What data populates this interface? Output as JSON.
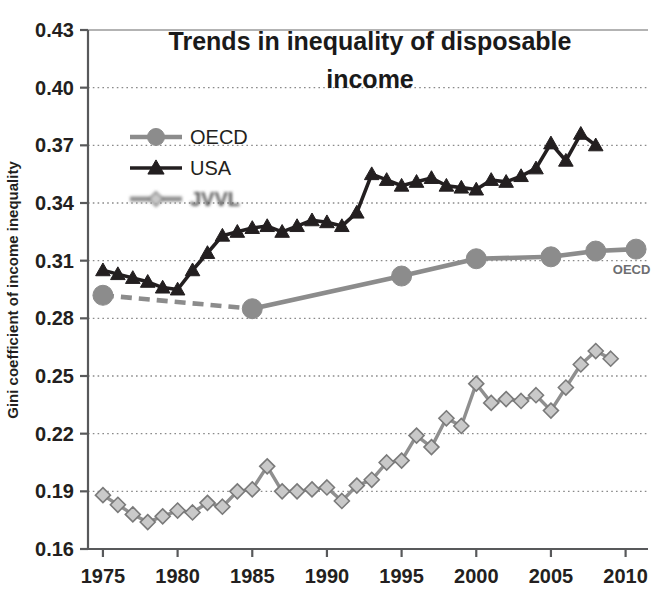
{
  "chart_data": {
    "type": "line",
    "title": "Trends in inequality of disposable income",
    "xlabel": "",
    "ylabel": "Gini coefficient of income inequality",
    "xlim": [
      1974,
      2011.5
    ],
    "ylim": [
      0.16,
      0.43
    ],
    "ytick_labels": [
      "0.43",
      "0.40",
      "0.37",
      "0.34",
      "0.31",
      "0.28",
      "0.25",
      "0.22",
      "0.19",
      "0.16"
    ],
    "ytick_values": [
      0.43,
      0.4,
      0.37,
      0.34,
      0.31,
      0.28,
      0.25,
      0.22,
      0.19,
      0.16
    ],
    "xtick_labels": [
      "1975",
      "1980",
      "1985",
      "1990",
      "1995",
      "2000",
      "2005",
      "2010"
    ],
    "xtick_values": [
      1975,
      1980,
      1985,
      1990,
      1995,
      2000,
      2005,
      2010
    ],
    "grid": "horizontal-dotted",
    "legend_position": "upper-left-inside",
    "annotations": [
      {
        "text": "OECD",
        "x": 2010.4,
        "y": 0.303
      }
    ],
    "series": [
      {
        "name": "OECD",
        "color": "#8c8c8c",
        "marker": "circle",
        "linestyle": "solid-with-leading-dashed",
        "points": [
          {
            "x": 1975,
            "y": 0.292
          },
          {
            "x": 1985,
            "y": 0.285
          },
          {
            "x": 1995,
            "y": 0.302
          },
          {
            "x": 2000,
            "y": 0.311
          },
          {
            "x": 2005,
            "y": 0.312
          },
          {
            "x": 2008,
            "y": 0.315
          },
          {
            "x": 2010.7,
            "y": 0.316
          }
        ],
        "dashed_segment": [
          1975,
          1985
        ]
      },
      {
        "name": "USA",
        "color": "#231f20",
        "marker": "triangle",
        "linestyle": "solid",
        "points": [
          {
            "x": 1975,
            "y": 0.305
          },
          {
            "x": 1976,
            "y": 0.303
          },
          {
            "x": 1977,
            "y": 0.301
          },
          {
            "x": 1978,
            "y": 0.299
          },
          {
            "x": 1979,
            "y": 0.296
          },
          {
            "x": 1980,
            "y": 0.295
          },
          {
            "x": 1981,
            "y": 0.305
          },
          {
            "x": 1982,
            "y": 0.314
          },
          {
            "x": 1983,
            "y": 0.323
          },
          {
            "x": 1984,
            "y": 0.325
          },
          {
            "x": 1985,
            "y": 0.327
          },
          {
            "x": 1986,
            "y": 0.328
          },
          {
            "x": 1987,
            "y": 0.325
          },
          {
            "x": 1988,
            "y": 0.328
          },
          {
            "x": 1989,
            "y": 0.331
          },
          {
            "x": 1990,
            "y": 0.33
          },
          {
            "x": 1991,
            "y": 0.328
          },
          {
            "x": 1992,
            "y": 0.335
          },
          {
            "x": 1993,
            "y": 0.355
          },
          {
            "x": 1994,
            "y": 0.352
          },
          {
            "x": 1995,
            "y": 0.349
          },
          {
            "x": 1996,
            "y": 0.351
          },
          {
            "x": 1997,
            "y": 0.353
          },
          {
            "x": 1998,
            "y": 0.349
          },
          {
            "x": 1999,
            "y": 0.348
          },
          {
            "x": 2000,
            "y": 0.347
          },
          {
            "x": 2001,
            "y": 0.352
          },
          {
            "x": 2002,
            "y": 0.351
          },
          {
            "x": 2003,
            "y": 0.354
          },
          {
            "x": 2004,
            "y": 0.358
          },
          {
            "x": 2005,
            "y": 0.371
          },
          {
            "x": 2006,
            "y": 0.362
          },
          {
            "x": 2007,
            "y": 0.376
          },
          {
            "x": 2008,
            "y": 0.37
          }
        ]
      },
      {
        "name": "JVVL",
        "color": "#a6a6a6",
        "marker": "diamond",
        "linestyle": "solid",
        "degraded": true,
        "points": [
          {
            "x": 1975,
            "y": 0.188
          },
          {
            "x": 1976,
            "y": 0.183
          },
          {
            "x": 1977,
            "y": 0.178
          },
          {
            "x": 1978,
            "y": 0.174
          },
          {
            "x": 1979,
            "y": 0.177
          },
          {
            "x": 1980,
            "y": 0.18
          },
          {
            "x": 1981,
            "y": 0.179
          },
          {
            "x": 1982,
            "y": 0.184
          },
          {
            "x": 1983,
            "y": 0.182
          },
          {
            "x": 1984,
            "y": 0.19
          },
          {
            "x": 1985,
            "y": 0.191
          },
          {
            "x": 1986,
            "y": 0.203
          },
          {
            "x": 1987,
            "y": 0.19
          },
          {
            "x": 1988,
            "y": 0.19
          },
          {
            "x": 1989,
            "y": 0.191
          },
          {
            "x": 1990,
            "y": 0.192
          },
          {
            "x": 1991,
            "y": 0.185
          },
          {
            "x": 1992,
            "y": 0.193
          },
          {
            "x": 1993,
            "y": 0.196
          },
          {
            "x": 1994,
            "y": 0.205
          },
          {
            "x": 1995,
            "y": 0.206
          },
          {
            "x": 1996,
            "y": 0.219
          },
          {
            "x": 1997,
            "y": 0.213
          },
          {
            "x": 1998,
            "y": 0.228
          },
          {
            "x": 1999,
            "y": 0.224
          },
          {
            "x": 2000,
            "y": 0.246
          },
          {
            "x": 2001,
            "y": 0.236
          },
          {
            "x": 2002,
            "y": 0.238
          },
          {
            "x": 2003,
            "y": 0.237
          },
          {
            "x": 2004,
            "y": 0.24
          },
          {
            "x": 2005,
            "y": 0.232
          },
          {
            "x": 2006,
            "y": 0.244
          },
          {
            "x": 2007,
            "y": 0.256
          },
          {
            "x": 2008,
            "y": 0.263
          },
          {
            "x": 2009,
            "y": 0.259
          }
        ]
      }
    ],
    "legend": [
      {
        "label": "OECD",
        "color": "#8c8c8c",
        "marker": "circle"
      },
      {
        "label": "USA",
        "color": "#231f20",
        "marker": "triangle"
      },
      {
        "label": "JVVL",
        "color": "#a6a6a6",
        "marker": "diamond",
        "degraded": true
      }
    ]
  },
  "colors": {
    "oecd": "#8c8c8c",
    "usa": "#231f20",
    "third": "#a6a6a6",
    "axis": "#58595b",
    "grid": "#8a8a8a",
    "text": "#231f20",
    "background": "#ffffff"
  }
}
